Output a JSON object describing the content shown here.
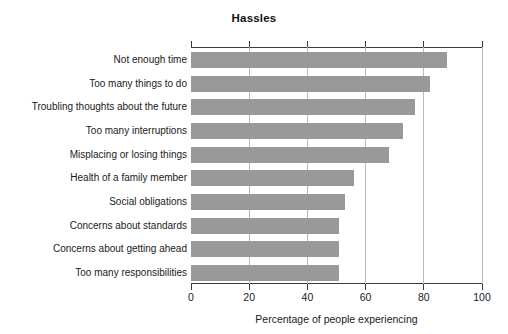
{
  "page": {
    "top_sliver_text": "· · ·"
  },
  "chart_data": {
    "type": "bar",
    "orientation": "horizontal",
    "title": "Hassles",
    "xlabel": "Percentage of people experiencing",
    "ylabel": "",
    "xlim": [
      0,
      100
    ],
    "xticks": [
      0,
      20,
      40,
      60,
      80,
      100
    ],
    "xtick_labels": [
      "0",
      "20",
      "40",
      "60",
      "80",
      "100"
    ],
    "grid": true,
    "grid_axis": "x",
    "legend": false,
    "bar_color": "#999999",
    "axis_color": "#3a3a3a",
    "gridline_color": "#b9b9b9",
    "categories": [
      "Not enough time",
      "Too many things to do",
      "Troubling thoughts about the future",
      "Too many interruptions",
      "Misplacing or losing things",
      "Health of a family member",
      "Social obligations",
      "Concerns about standards",
      "Concerns about getting ahead",
      "Too many responsibilities"
    ],
    "values": [
      88,
      82,
      77,
      73,
      68,
      56,
      53,
      51,
      51,
      51
    ]
  }
}
